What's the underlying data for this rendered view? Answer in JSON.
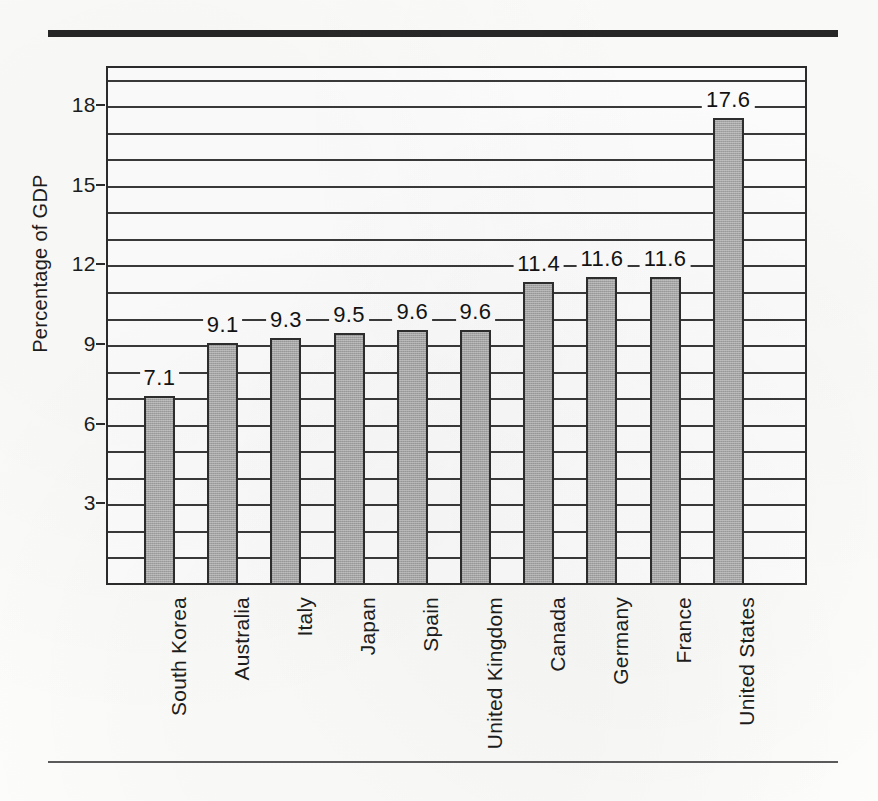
{
  "chart_data": {
    "type": "bar",
    "title": "",
    "subtitle": "",
    "xlabel": "",
    "ylabel": "Percentage of GDP",
    "categories": [
      "South Korea",
      "Australia",
      "Italy",
      "Japan",
      "Spain",
      "United Kingdom",
      "Canada",
      "Germany",
      "France",
      "United States"
    ],
    "values": [
      7.1,
      9.1,
      9.3,
      9.5,
      9.6,
      9.6,
      11.4,
      11.6,
      11.6,
      17.6
    ],
    "value_labels": [
      "7.1",
      "9.1",
      "9.3",
      "9.5",
      "9.6",
      "9.6",
      "11.4",
      "11.6",
      "11.6",
      "17.6"
    ],
    "ylim": [
      0,
      19.5
    ],
    "ytick_labels": [
      "18",
      "15",
      "12",
      "9",
      "6",
      "3"
    ],
    "ytick_values": [
      18,
      15,
      12,
      9,
      6,
      3
    ],
    "gridline_interval": 1,
    "grid": true,
    "legend": "none",
    "bar_color": "#a9a9a9",
    "bar_border_color": "#2e2e2e",
    "axis_color": "#2c2c2c",
    "text_color": "#1d1d1d",
    "background_color": "#ffffff"
  },
  "figure": {
    "top_rule_color": "#272727",
    "bottom_rule_color": "#5b5b5b"
  }
}
